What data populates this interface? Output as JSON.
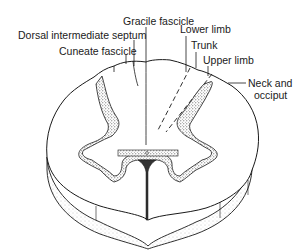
{
  "figure": {
    "labels": {
      "gracile_fascicle": "Gracile fascicle",
      "dorsal_intermediate_septum": "Dorsal intermediate septum",
      "cuneate_fascicle": "Cuneate fascicle",
      "lower_limb": "Lower limb",
      "trunk": "Trunk",
      "upper_limb": "Upper limb",
      "neck_and_occiput_line1": "Neck and",
      "neck_and_occiput_line2": "occiput"
    },
    "colors": {
      "line": "#1a1a1a",
      "gray_matter": "#9a9a9a",
      "background": "#ffffff"
    }
  }
}
